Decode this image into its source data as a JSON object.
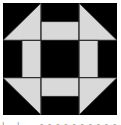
{
  "block": {
    "pattern": "churn-dash-quilt-block",
    "grid": 3,
    "colors": {
      "dark": "#000000",
      "light": "#d9d9d9",
      "seam": "#2a2a2a",
      "background": "#ffffff"
    },
    "cells": [
      {
        "row": 0,
        "col": 0,
        "type": "half-square-triangle",
        "light_corner": "bottom-right"
      },
      {
        "row": 0,
        "col": 1,
        "type": "bar",
        "light_half": "bottom"
      },
      {
        "row": 0,
        "col": 2,
        "type": "half-square-triangle",
        "light_corner": "bottom-left"
      },
      {
        "row": 1,
        "col": 0,
        "type": "bar",
        "light_half": "right"
      },
      {
        "row": 1,
        "col": 1,
        "type": "solid",
        "color": "dark"
      },
      {
        "row": 1,
        "col": 2,
        "type": "bar",
        "light_half": "left"
      },
      {
        "row": 2,
        "col": 0,
        "type": "half-square-triangle",
        "light_corner": "top-right"
      },
      {
        "row": 2,
        "col": 1,
        "type": "bar",
        "light_half": "top"
      },
      {
        "row": 2,
        "col": 2,
        "type": "half-square-triangle",
        "light_corner": "top-left"
      }
    ]
  },
  "caption": {
    "text": "",
    "note": "cut-off illegible caption text at bottom edge"
  }
}
